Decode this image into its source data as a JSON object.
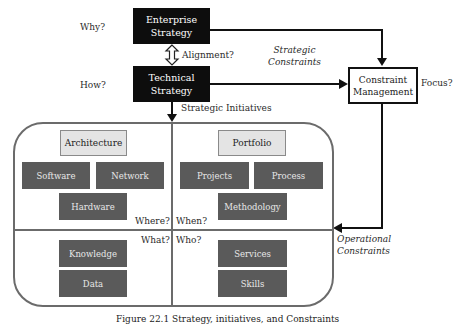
{
  "diagram": {
    "top": {
      "why_label": "Why?",
      "how_label": "How?",
      "enterprise_strategy": "Enterprise\nStrategy",
      "technical_strategy": "Technical\nStrategy",
      "alignment_label": "Alignment?",
      "strategic_initiatives_label": "Strategic Initiatives",
      "strategic_constraints_label": "Strategic\nConstraints",
      "constraint_management": "Constraint\nManagement",
      "focus_label": "Focus?",
      "operational_constraints_label": "Operational\nConstraints"
    },
    "quadrants": {
      "top_left": {
        "header": "Architecture",
        "items": [
          "Software",
          "Network",
          "Hardware"
        ],
        "corner_label": "Where?"
      },
      "top_right": {
        "header": "Portfolio",
        "items": [
          "Projects",
          "Process",
          "Methodology"
        ],
        "corner_label": "When?"
      },
      "bottom_left": {
        "items": [
          "Knowledge",
          "Data"
        ],
        "corner_label": "What?"
      },
      "bottom_right": {
        "items": [
          "Services",
          "Skills"
        ],
        "corner_label": "Who?"
      }
    },
    "caption": "Figure 22.1 Strategy, initiatives, and Constraints"
  },
  "colors": {
    "black_box": "#0d0d0d",
    "dark_box": "#5a5a5a",
    "light_box": "#e4e4e4",
    "frame": "#6b6b6b"
  }
}
